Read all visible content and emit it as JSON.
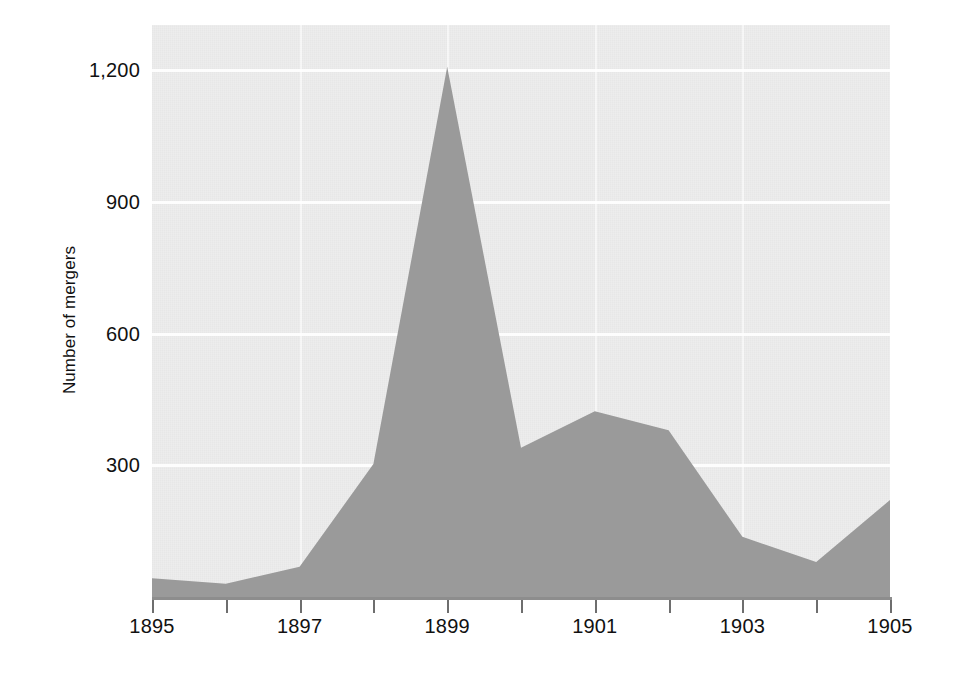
{
  "chart_data": {
    "type": "area",
    "title": "",
    "subtitle": "",
    "xlabel": "",
    "ylabel": "Number of mergers",
    "x": [
      1895,
      1896,
      1897,
      1898,
      1899,
      1900,
      1901,
      1902,
      1903,
      1904,
      1905
    ],
    "values": [
      43,
      30,
      69,
      303,
      1208,
      340,
      423,
      380,
      137,
      80,
      221
    ],
    "series": [
      {
        "name": "Number of mergers",
        "values": [
          43,
          30,
          69,
          303,
          1208,
          340,
          423,
          380,
          137,
          80,
          221
        ]
      }
    ],
    "xlim": [
      1895,
      1905
    ],
    "ylim": [
      0,
      1300
    ],
    "x_tick_values": [
      1895,
      1896,
      1897,
      1898,
      1899,
      1900,
      1901,
      1902,
      1903,
      1904,
      1905
    ],
    "x_tick_labels": [
      "1895",
      "",
      "1897",
      "",
      "1899",
      "",
      "1901",
      "",
      "1903",
      "",
      "1905"
    ],
    "y_tick_values": [
      300,
      600,
      900,
      1200
    ],
    "y_tick_labels": [
      "300",
      "600",
      "900",
      "1,200"
    ],
    "grid": "horizontal-white-on-gray",
    "legend": "none",
    "colors": {
      "area_fill": "#9a9a9a",
      "plot_background": "#ededed",
      "gridline": "#fdfdfd",
      "axis": "#8d8d8d",
      "text": "#111111",
      "page_background": "#ffffff"
    }
  },
  "axis": {
    "y_title": "Number of mergers",
    "y_ticks": [
      {
        "label": "1,200",
        "value": 1200
      },
      {
        "label": "900",
        "value": 900
      },
      {
        "label": "600",
        "value": 600
      },
      {
        "label": "300",
        "value": 300
      }
    ],
    "x_ticks": [
      {
        "label": "1895",
        "value": 1895
      },
      {
        "label": "",
        "value": 1896
      },
      {
        "label": "1897",
        "value": 1897
      },
      {
        "label": "",
        "value": 1898
      },
      {
        "label": "1899",
        "value": 1899
      },
      {
        "label": "",
        "value": 1900
      },
      {
        "label": "1901",
        "value": 1901
      },
      {
        "label": "",
        "value": 1902
      },
      {
        "label": "1903",
        "value": 1903
      },
      {
        "label": "",
        "value": 1904
      },
      {
        "label": "1905",
        "value": 1905
      }
    ]
  }
}
